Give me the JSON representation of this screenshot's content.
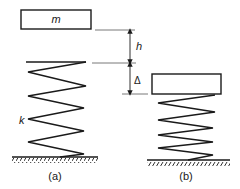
{
  "diagram": {
    "panel_a": {
      "caption": "(a)",
      "mass_label": "m",
      "spring_label": "k"
    },
    "panel_b": {
      "caption": "(b)"
    },
    "dimensions": {
      "drop_height": "h",
      "compression": "Δ"
    },
    "colors": {
      "stroke": "#1a1a1a",
      "background": "#ffffff"
    }
  }
}
